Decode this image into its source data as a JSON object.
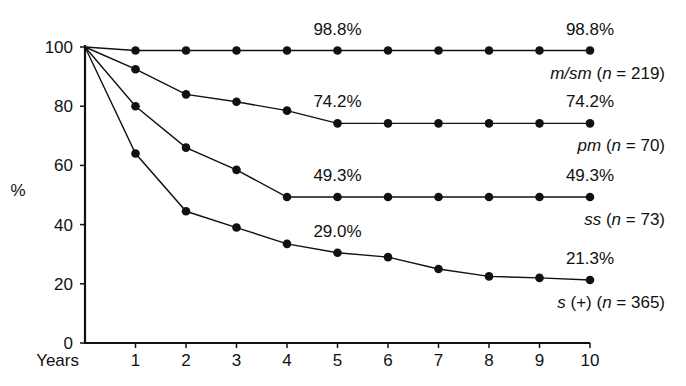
{
  "chart_data": {
    "type": "line",
    "title": "",
    "xlabel": "Years",
    "ylabel": "%",
    "xlim": [
      0,
      10
    ],
    "ylim": [
      0,
      100
    ],
    "x_ticks": [
      1,
      2,
      3,
      4,
      5,
      6,
      7,
      8,
      9,
      10
    ],
    "y_ticks": [
      0,
      20,
      40,
      60,
      80,
      100
    ],
    "grid": false,
    "x": [
      0,
      1,
      2,
      3,
      4,
      5,
      6,
      7,
      8,
      9,
      10
    ],
    "series": [
      {
        "name": "m/sm",
        "n_label": "(n = 219)",
        "italic_name": "m/sm",
        "paren": "(",
        "n_var": "n",
        "eq": " = 219)",
        "values": [
          100,
          98.8,
          98.8,
          98.8,
          98.8,
          98.8,
          98.8,
          98.8,
          98.8,
          98.8,
          98.8
        ],
        "annotations": [
          {
            "x": 5,
            "text": "98.8%"
          },
          {
            "x": 10,
            "text": "98.8%"
          }
        ]
      },
      {
        "name": "pm",
        "italic_name": "pm",
        "paren": "(",
        "n_var": "n",
        "eq": " = 70)",
        "values": [
          100,
          92.5,
          84,
          81.5,
          78.5,
          74.2,
          74.2,
          74.2,
          74.2,
          74.2,
          74.2
        ],
        "annotations": [
          {
            "x": 5,
            "text": "74.2%"
          },
          {
            "x": 10,
            "text": "74.2%"
          }
        ]
      },
      {
        "name": "ss",
        "italic_name": "ss",
        "paren": "(",
        "n_var": "n",
        "eq": " = 73)",
        "values": [
          100,
          80,
          66,
          58.5,
          49.3,
          49.3,
          49.3,
          49.3,
          49.3,
          49.3,
          49.3
        ],
        "annotations": [
          {
            "x": 5,
            "text": "49.3%"
          },
          {
            "x": 10,
            "text": "49.3%"
          }
        ]
      },
      {
        "name": "s (+)",
        "italic_name": "s",
        "extra": " (+) ",
        "paren": "(",
        "n_var": "n",
        "eq": " = 365)",
        "values": [
          100,
          64,
          44.5,
          39,
          33.5,
          30.5,
          29.0,
          25,
          22.5,
          22,
          21.3
        ],
        "annotations": [
          {
            "x": 5,
            "text": "29.0%"
          },
          {
            "x": 10,
            "text": "21.3%"
          }
        ]
      }
    ]
  }
}
